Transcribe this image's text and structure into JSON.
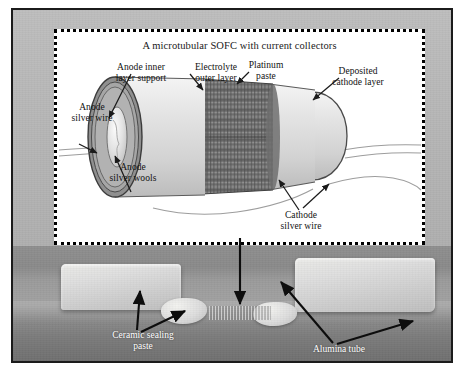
{
  "figure": {
    "inset_title": "A microtubular SOFC with current collectors"
  },
  "schematic_labels": {
    "anode_inner": "Anode inner\nlayer support",
    "anode_silver_wire": "Anode\nsilver wire",
    "anode_silver_wools": "Anode\nsilver wools",
    "electrolyte": "Electrolyte\nouter layer",
    "platinum_paste": "Platinum\npaste",
    "deposited_cathode": "Deposited\ncathode layer",
    "cathode_silver_wire": "Cathode\nsilver wire"
  },
  "photo_labels": {
    "ceramic_sealing_paste": "Ceramic sealing\npaste",
    "alumina_tube": "Alumina tube"
  },
  "colors": {
    "plate_border": "#1b1b1b",
    "plate_background": "#b4b4b4",
    "inset_background": "#ffffff",
    "inset_border": "#000000",
    "photo_background": "#8e8e8e",
    "label_text": "#111111",
    "photo_label_text": "#ffffff",
    "tube_body": "#dcdcdc",
    "tube_outline": "#4a4a4a",
    "electrolyte_ring": "#6e6e6e",
    "anode_ring": "#a8a8a8",
    "silver_wool": "#e8e8e8",
    "platinum_coil": "#7a7a7a",
    "wire_stroke": "#9a9a9a",
    "arrow_stroke": "#1a1a1a"
  },
  "icons": {
    "arrow": "annotation-arrow",
    "coil": "platinum-coil",
    "tube": "sofc-tube"
  }
}
